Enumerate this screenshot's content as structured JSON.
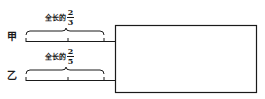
{
  "diagram": {
    "rows": [
      {
        "name": "甲",
        "annotation_prefix": "全长的",
        "fraction": {
          "numerator": "2",
          "denominator": "3"
        }
      },
      {
        "name": "乙",
        "annotation_prefix": "全长的",
        "fraction": {
          "numerator": "2",
          "denominator": "5"
        }
      }
    ],
    "colors": {
      "stroke": "#1a1a1a",
      "background": "#ffffff"
    }
  }
}
